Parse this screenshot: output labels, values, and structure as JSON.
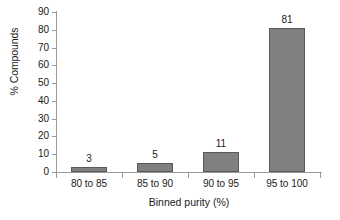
{
  "chart_data": {
    "type": "bar",
    "title": "",
    "subtitle": "",
    "xlabel": "Binned purity (%)",
    "ylabel": "% Compounds",
    "categories": [
      "80 to 85",
      "85 to 90",
      "90 to 95",
      "95 to 100"
    ],
    "values": [
      3,
      5,
      11,
      81
    ],
    "data_labels": [
      "3",
      "5",
      "11",
      "81"
    ],
    "ylim": [
      0,
      90
    ],
    "ytick_labels": [
      "0",
      "10",
      "20",
      "30",
      "40",
      "50",
      "60",
      "70",
      "80",
      "90"
    ],
    "ytick_values": [
      0,
      10,
      20,
      30,
      40,
      50,
      60,
      70,
      80,
      90
    ],
    "grid": false,
    "legend": null,
    "legend_position": "none",
    "series": [
      {
        "name": "% Compounds",
        "values": [
          3,
          5,
          11,
          81
        ],
        "bar_fill": "#808080",
        "bar_border": "#595959"
      }
    ],
    "colors": {
      "bar_fill": "#808080",
      "bar_border": "#595959",
      "axis": "#9a9a9a",
      "text": "#1a1a1a",
      "background": "#ffffff"
    }
  }
}
